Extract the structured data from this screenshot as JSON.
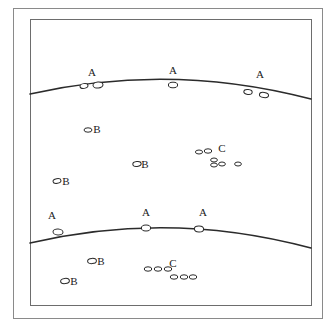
{
  "figure": {
    "background_color": "#ffffff",
    "line_color": "#2b2b2b",
    "frame": {
      "outer": {
        "x": 13,
        "y": 8,
        "width": 309,
        "height": 310,
        "stroke": "#8a8a8a"
      },
      "inner": {
        "x": 30,
        "y": 19,
        "width": 281,
        "height": 286,
        "stroke": "#6d6d6d"
      }
    },
    "horizons": [
      {
        "name": "upper-horizon",
        "path": "M 30 94 Q 170 62 311 99"
      },
      {
        "name": "lower-horizon",
        "path": "M 30 243 Q 170 210 311 248"
      }
    ],
    "markers": [
      {
        "id": "a-upper-left",
        "label": "A",
        "label_x": 92,
        "label_y": 76,
        "clasts": [
          {
            "x": 84,
            "y": 86,
            "rx": 4.0,
            "ry": 2.4,
            "rot": -8
          },
          {
            "x": 98,
            "y": 85,
            "rx": 5.0,
            "ry": 3.0,
            "rot": -6
          }
        ]
      },
      {
        "id": "a-upper-mid",
        "label": "A",
        "label_x": 173,
        "label_y": 74,
        "clasts": [
          {
            "x": 173,
            "y": 85,
            "rx": 4.6,
            "ry": 2.8,
            "rot": 0
          }
        ]
      },
      {
        "id": "a-upper-right",
        "label": "A",
        "label_x": 260,
        "label_y": 78,
        "clasts": [
          {
            "x": 248,
            "y": 92,
            "rx": 4.2,
            "ry": 2.4,
            "rot": 6
          },
          {
            "x": 264,
            "y": 95,
            "rx": 4.6,
            "ry": 2.6,
            "rot": 8
          }
        ]
      },
      {
        "id": "b-upper-left",
        "label": "B",
        "label_x": 97,
        "label_y": 133,
        "clasts": [
          {
            "x": 88,
            "y": 130,
            "rx": 4.0,
            "ry": 2.2,
            "rot": 0
          }
        ]
      },
      {
        "id": "b-upper-mid",
        "label": "B",
        "label_x": 145,
        "label_y": 168,
        "clasts": [
          {
            "x": 137,
            "y": 164,
            "rx": 4.2,
            "ry": 2.4,
            "rot": -6
          }
        ]
      },
      {
        "id": "b-upper-lowleft",
        "label": "B",
        "label_x": 66,
        "label_y": 185,
        "clasts": [
          {
            "x": 57,
            "y": 181,
            "rx": 4.0,
            "ry": 2.4,
            "rot": -10
          }
        ]
      },
      {
        "id": "a-lower-left",
        "label": "A",
        "label_x": 52,
        "label_y": 219,
        "clasts": [
          {
            "x": 58,
            "y": 232,
            "rx": 5.0,
            "ry": 3.0,
            "rot": 4
          }
        ]
      },
      {
        "id": "a-lower-mid",
        "label": "A",
        "label_x": 146,
        "label_y": 216,
        "clasts": [
          {
            "x": 146,
            "y": 228,
            "rx": 4.6,
            "ry": 3.0,
            "rot": 0
          }
        ]
      },
      {
        "id": "a-lower-right",
        "label": "A",
        "label_x": 203,
        "label_y": 216,
        "clasts": [
          {
            "x": 199,
            "y": 229,
            "rx": 4.6,
            "ry": 3.0,
            "rot": 2
          }
        ]
      },
      {
        "id": "b-lower-upper",
        "label": "B",
        "label_x": 101,
        "label_y": 265,
        "clasts": [
          {
            "x": 92,
            "y": 261,
            "rx": 4.4,
            "ry": 2.6,
            "rot": -4
          }
        ]
      },
      {
        "id": "b-lower-lower",
        "label": "B",
        "label_x": 74,
        "label_y": 285,
        "clasts": [
          {
            "x": 65,
            "y": 281,
            "rx": 4.4,
            "ry": 2.6,
            "rot": -6
          }
        ]
      }
    ],
    "clusters": [
      {
        "id": "c-upper",
        "label": "C",
        "label_x": 222,
        "label_y": 152,
        "clasts": [
          {
            "x": 199,
            "y": 152,
            "rx": 3.6,
            "ry": 2.0,
            "rot": 0
          },
          {
            "x": 208,
            "y": 151,
            "rx": 3.8,
            "ry": 2.2,
            "rot": 0
          },
          {
            "x": 214,
            "y": 160,
            "rx": 3.4,
            "ry": 2.0,
            "rot": 0
          },
          {
            "x": 214,
            "y": 165,
            "rx": 3.4,
            "ry": 2.0,
            "rot": 0
          },
          {
            "x": 222,
            "y": 164,
            "rx": 3.4,
            "ry": 2.0,
            "rot": 0
          },
          {
            "x": 238,
            "y": 164,
            "rx": 3.4,
            "ry": 2.0,
            "rot": 0
          }
        ]
      },
      {
        "id": "c-lower",
        "label": "C",
        "label_x": 173,
        "label_y": 267,
        "clasts": [
          {
            "x": 148,
            "y": 269,
            "rx": 3.8,
            "ry": 2.2,
            "rot": 0
          },
          {
            "x": 158,
            "y": 269,
            "rx": 3.8,
            "ry": 2.2,
            "rot": 0
          },
          {
            "x": 168,
            "y": 269,
            "rx": 3.8,
            "ry": 2.2,
            "rot": 0
          },
          {
            "x": 174,
            "y": 277,
            "rx": 3.8,
            "ry": 2.2,
            "rot": 0
          },
          {
            "x": 184,
            "y": 277,
            "rx": 3.8,
            "ry": 2.2,
            "rot": 0
          },
          {
            "x": 193,
            "y": 277,
            "rx": 3.8,
            "ry": 2.2,
            "rot": 0
          }
        ]
      }
    ]
  }
}
